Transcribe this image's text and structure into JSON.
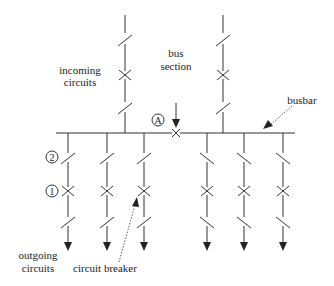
{
  "diagram": {
    "labels": {
      "incoming_line1": "incoming",
      "incoming_line2": "circuits",
      "bus_section_line1": "bus",
      "bus_section_line2": "section",
      "busbar": "busbar",
      "outgoing_line1": "outgoing",
      "outgoing_line2": "circuits",
      "circuit_breaker": "circuit breaker"
    },
    "markers": {
      "A": "A",
      "one": "1",
      "two": "2"
    },
    "busbar": {
      "x1": 56,
      "x2": 295,
      "y": 133
    },
    "bus_section_breaker": {
      "x": 176,
      "y": 133
    },
    "incoming_feeders": [
      {
        "x": 125,
        "top": 15
      },
      {
        "x": 223,
        "top": 15
      }
    ],
    "outgoing_feeders": [
      {
        "x": 68
      },
      {
        "x": 107
      },
      {
        "x": 144
      },
      {
        "x": 207
      },
      {
        "x": 244
      },
      {
        "x": 283
      }
    ],
    "colors": {
      "line": "#333333",
      "text": "#222222",
      "background": "#ffffff"
    }
  }
}
